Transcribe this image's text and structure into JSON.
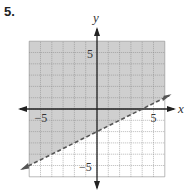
{
  "problem_number": "5.",
  "chart_data": {
    "type": "inequality-graph",
    "title": "",
    "xlabel": "x",
    "ylabel": "y",
    "xlim": [
      -6,
      6
    ],
    "ylim": [
      -6,
      6
    ],
    "grid": true,
    "tick_labels": {
      "x": [
        {
          "value": -5,
          "label": "−5"
        },
        {
          "value": 5,
          "label": "5"
        }
      ],
      "y": [
        {
          "value": 5,
          "label": "5"
        },
        {
          "value": -5,
          "label": "−5"
        }
      ]
    },
    "boundary_line": {
      "equation": "y = 0.5x − 2",
      "slope": 0.5,
      "intercept": -2,
      "style": "dashed",
      "points": [
        [
          -6,
          -5
        ],
        [
          6,
          1
        ]
      ]
    },
    "inequality": "y > 0.5x − 2",
    "shaded_region": "above",
    "colors": {
      "shade": "#cfcfcf",
      "grid": "#8a8a8a",
      "axis": "#222222",
      "line": "#555555"
    }
  }
}
